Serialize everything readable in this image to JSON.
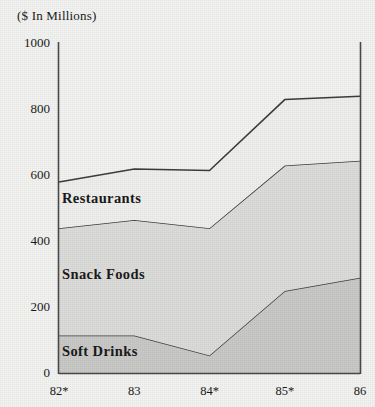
{
  "chart_data": {
    "type": "area",
    "stacked": true,
    "title": "",
    "subtitle": "",
    "unit_label": "($ In Millions)",
    "xlabel": "",
    "ylabel": "",
    "categories": [
      "82*",
      "83",
      "84*",
      "85*",
      "86"
    ],
    "x_tick_labels": [
      "82*",
      "83",
      "84*",
      "85*",
      "86"
    ],
    "y_tick_labels": [
      "0",
      "200",
      "400",
      "600",
      "800",
      "1000"
    ],
    "y_tick_values": [
      0,
      200,
      400,
      600,
      800,
      1000
    ],
    "ylim": [
      0,
      1000
    ],
    "grid": false,
    "legend_position": "inline-labels",
    "series": [
      {
        "name": "Soft Drinks",
        "values": [
          115,
          115,
          55,
          250,
          290
        ],
        "color": "#c9c9c7",
        "label_x": 62,
        "label_y": 343
      },
      {
        "name": "Snack Foods",
        "values": [
          325,
          350,
          385,
          380,
          355
        ],
        "cumulative_top": [
          440,
          465,
          440,
          630,
          645
        ],
        "color": "#dcdcda",
        "label_x": 62,
        "label_y": 266
      },
      {
        "name": "Restaurants",
        "values": [
          140,
          155,
          175,
          200,
          195
        ],
        "cumulative_top": [
          580,
          620,
          615,
          830,
          840
        ],
        "color": "#efefed",
        "label_x": 62,
        "label_y": 190
      }
    ],
    "annotations": []
  },
  "colors": {
    "background": "#f3f3f1",
    "axis_line": "#4a4a4a",
    "boundary_line": "#3c3c3c",
    "text": "#1a1a1a",
    "soft_drinks_fill": "#c9c9c7",
    "snack_foods_fill": "#dcdcda",
    "restaurants_fill": "#efefed"
  }
}
